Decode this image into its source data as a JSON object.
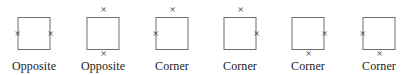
{
  "figure": {
    "type": "diagram",
    "background_color": "#ffffff",
    "square_stroke_color": "#6e6e6e",
    "marker_glyph": "×",
    "marker_color": "#2b2b2b",
    "items": [
      {
        "index": 1,
        "label": "Opposite",
        "markers": [
          "left",
          "right"
        ],
        "left": 0,
        "width": 68
      },
      {
        "index": 2,
        "label": "Opposite",
        "markers": [
          "top",
          "bottom"
        ],
        "left": 68,
        "width": 70
      },
      {
        "index": 3,
        "label": "Corner",
        "markers": [
          "top",
          "left"
        ],
        "left": 138,
        "width": 68
      },
      {
        "index": 4,
        "label": "Corner",
        "markers": [
          "top",
          "right"
        ],
        "left": 206,
        "width": 68
      },
      {
        "index": 5,
        "label": "Corner",
        "markers": [
          "right",
          "bottom"
        ],
        "left": 274,
        "width": 68
      },
      {
        "index": 6,
        "label": "Corner",
        "markers": [
          "left",
          "bottom"
        ],
        "left": 342,
        "width": 74
      }
    ]
  }
}
